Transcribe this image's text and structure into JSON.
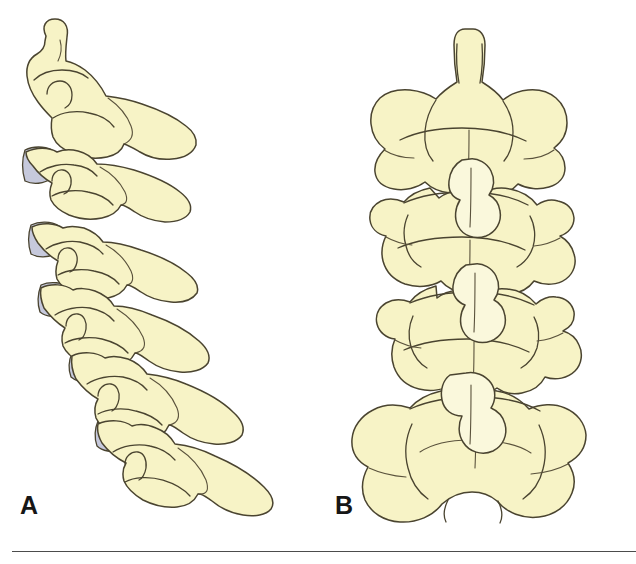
{
  "figure": {
    "kind": "anatomical-illustration",
    "background_color": "#ffffff",
    "panels": [
      {
        "id": "A",
        "label": "A",
        "view": "lateral view of cervical vertebrae",
        "vertebra_count": 6,
        "disc_count": 5,
        "label_position": {
          "x": 20,
          "y": 493
        }
      },
      {
        "id": "B",
        "label": "B",
        "view": "posterior view of cervical vertebrae",
        "vertebra_count": 4,
        "disc_count": 3,
        "label_position": {
          "x": 335,
          "y": 493
        }
      }
    ]
  },
  "colors": {
    "bone_fill": "#F7F3C6",
    "bone_fill_light": "#FAF8DC",
    "disc_fill": "#C6C9DC",
    "outline": "#4a4430",
    "outline_dark": "#2d2a1e",
    "label_text": "#161616",
    "rule": "#4c4c4c",
    "background": "#ffffff"
  },
  "rule": {
    "present": true,
    "x": 12,
    "y": 551,
    "width": 624,
    "thickness": 1
  },
  "caption": {
    "visible_text": "",
    "note": "caption text cropped off at bottom edge"
  }
}
